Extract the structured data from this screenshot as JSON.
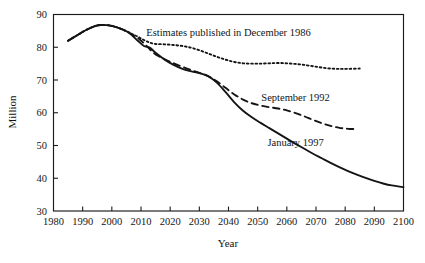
{
  "chart_data": {
    "type": "line",
    "title": "",
    "xlabel": "Year",
    "ylabel": "Million",
    "xlim": [
      1980,
      2100
    ],
    "ylim": [
      30,
      90
    ],
    "xticks": [
      1980,
      1990,
      2000,
      2010,
      2020,
      2030,
      2040,
      2050,
      2060,
      2070,
      2080,
      2090,
      2100
    ],
    "yticks": [
      30,
      40,
      50,
      60,
      70,
      80,
      90
    ],
    "grid": false,
    "legend_position": "inline-annotations",
    "series": [
      {
        "name": "Estimates published in December 1986",
        "style": "dotted",
        "label_x": 2040,
        "label_y": 83.5,
        "x": [
          1985,
          1988,
          1991,
          1994,
          1996,
          1999,
          2002,
          2005,
          2007,
          2009,
          2011,
          2013,
          2015,
          2018,
          2021,
          2024,
          2027,
          2030,
          2033,
          2036,
          2039,
          2042,
          2045,
          2048,
          2051,
          2054,
          2057,
          2060,
          2063,
          2066,
          2069,
          2072,
          2075,
          2078,
          2081,
          2085
        ],
        "y": [
          82.0,
          83.6,
          85.2,
          86.4,
          86.8,
          86.7,
          86.0,
          84.9,
          84.0,
          83.2,
          82.2,
          81.4,
          81.0,
          80.9,
          80.7,
          80.4,
          79.9,
          79.1,
          78.1,
          77.1,
          76.2,
          75.5,
          75.1,
          75.0,
          75.0,
          75.1,
          75.2,
          75.1,
          74.9,
          74.6,
          74.2,
          73.8,
          73.5,
          73.4,
          73.4,
          73.5
        ]
      },
      {
        "name": "September 1992",
        "style": "dashed",
        "label_x": 2063,
        "label_y": 63.5,
        "x": [
          1985,
          1988,
          1991,
          1994,
          1996,
          1999,
          2002,
          2005,
          2007,
          2009,
          2011,
          2013,
          2015,
          2018,
          2021,
          2024,
          2027,
          2030,
          2033,
          2036,
          2039,
          2042,
          2045,
          2048,
          2051,
          2054,
          2057,
          2060,
          2063,
          2066,
          2069,
          2072,
          2075,
          2078,
          2081,
          2084
        ],
        "y": [
          82.0,
          83.6,
          85.2,
          86.4,
          86.8,
          86.7,
          86.0,
          84.9,
          83.9,
          82.8,
          81.2,
          79.4,
          77.8,
          76.4,
          75.2,
          74.1,
          73.1,
          72.2,
          71.2,
          69.6,
          67.6,
          65.6,
          64.0,
          62.9,
          62.2,
          61.7,
          61.3,
          60.7,
          59.9,
          58.9,
          57.8,
          56.8,
          56.0,
          55.4,
          55.1,
          55.0
        ]
      },
      {
        "name": "January 1997",
        "style": "solid",
        "label_x": 2063,
        "label_y": 50.0,
        "x": [
          1985,
          1988,
          1991,
          1994,
          1996,
          1999,
          2002,
          2005,
          2007,
          2009,
          2011,
          2013,
          2015,
          2018,
          2021,
          2024,
          2027,
          2030,
          2033,
          2036,
          2039,
          2042,
          2045,
          2048,
          2051,
          2054,
          2057,
          2060,
          2063,
          2066,
          2069,
          2072,
          2075,
          2078,
          2081,
          2084,
          2087,
          2090,
          2093,
          2096,
          2100
        ],
        "y": [
          82.0,
          83.6,
          85.2,
          86.4,
          86.8,
          86.7,
          86.0,
          84.9,
          83.6,
          81.9,
          80.4,
          79.9,
          78.3,
          76.3,
          74.7,
          73.5,
          72.7,
          72.1,
          71.2,
          69.2,
          66.3,
          63.2,
          60.6,
          58.6,
          56.9,
          55.3,
          53.7,
          52.1,
          50.5,
          49.0,
          47.5,
          46.1,
          44.7,
          43.4,
          42.2,
          41.1,
          40.1,
          39.2,
          38.4,
          37.8,
          37.3
        ]
      }
    ]
  },
  "axis": {
    "ylabel": "Million",
    "xlabel": "Year"
  }
}
